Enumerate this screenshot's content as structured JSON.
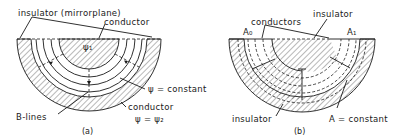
{
  "figure_a": {
    "caption": "(a)",
    "labels": {
      "insulator": "insulator (mirrorplane)",
      "inner_conductor": "conductor",
      "psi1": "ψ₁",
      "psi_constant": "ψ = constant",
      "outer_conductor": "conductor",
      "psi2": "ψ = ψ₂",
      "b_lines": "B-lines"
    }
  },
  "figure_b": {
    "caption": "(b)",
    "labels": {
      "conductors": "conductors",
      "insulator_top": "insulator",
      "a0": "A₀",
      "a1": "A₁",
      "insulator_bottom": "insulator",
      "a_constant": "A = constant"
    }
  },
  "colors": {
    "ink": "#1a1a1a",
    "background": "#ffffff"
  }
}
